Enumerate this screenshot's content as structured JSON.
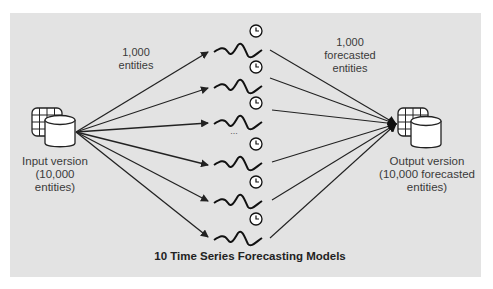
{
  "figure": {
    "title": "10 Time Series Forecasting Models",
    "input": {
      "label_line1": "Input version",
      "label_line2": "(10,000",
      "label_line3": "entities)",
      "icon": "database-table-icon"
    },
    "output": {
      "label_line1": "Output version",
      "label_line2": "(10,000 forecasted",
      "label_line3": "entities)",
      "icon": "database-table-icon"
    },
    "input_annotation": {
      "line1": "1,000",
      "line2": "entities"
    },
    "output_annotation": {
      "line1": "1,000",
      "line2": "forecasted",
      "line3": "entities"
    },
    "ellipsis": "...",
    "models": [
      {
        "icon": "time-series-clock-icon"
      },
      {
        "icon": "time-series-clock-icon"
      },
      {
        "icon": "time-series-clock-icon"
      },
      {
        "icon": "time-series-clock-icon"
      },
      {
        "icon": "time-series-clock-icon"
      },
      {
        "icon": "time-series-clock-icon"
      }
    ],
    "colors": {
      "panel": "#e3e3e3",
      "stroke": "#222222",
      "text": "#3a3a3a"
    }
  }
}
